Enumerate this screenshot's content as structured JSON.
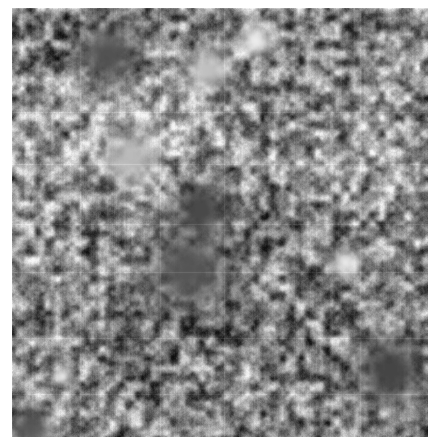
{
  "canvas": {
    "width": 437,
    "height": 447,
    "background_color": "#ffffff"
  },
  "image_panel": {
    "label": "grayscale-speckle-micrograph",
    "x": 12,
    "y": 8,
    "width": 416,
    "height": 429,
    "alt_text": "",
    "render": {
      "type": "speckle-noise",
      "colorspace": "grayscale",
      "mean_level": 138,
      "min_level": 16,
      "max_level": 246,
      "base_color": "#8a8a8a",
      "dark_color": "#1e1e1e",
      "light_color": "#f0f0f0",
      "blob_scale_px": 9,
      "fine_grain_px": 2,
      "contrast": 0.82,
      "vertical_streak_strength": 0.07,
      "seed": 20240517
    },
    "tiling": {
      "visible_seams": true,
      "seam_opacity": 0.07,
      "seam_color": "#ffffff",
      "columns_x": [
        0,
        68,
        148,
        212,
        282,
        348
      ],
      "rows_y": [
        0,
        104,
        156,
        216,
        264,
        330,
        386
      ]
    },
    "features": [
      {
        "name": "dark-point-center",
        "x": 189,
        "y": 201,
        "radius": 7,
        "level": 16
      },
      {
        "name": "dark-halo-center",
        "x": 189,
        "y": 201,
        "radius": 26,
        "level": 74
      },
      {
        "name": "bright-patch-upper-right",
        "x": 243,
        "y": 32,
        "radius": 17,
        "level": 236
      },
      {
        "name": "bright-blob-right",
        "x": 333,
        "y": 254,
        "radius": 14,
        "level": 232
      },
      {
        "name": "bright-spot-left-lower",
        "x": 50,
        "y": 368,
        "radius": 9,
        "level": 228
      },
      {
        "name": "dark-point-right",
        "x": 329,
        "y": 129,
        "radius": 5,
        "level": 36
      },
      {
        "name": "dark-cluster-lower-right",
        "x": 378,
        "y": 362,
        "radius": 34,
        "level": 70
      },
      {
        "name": "dark-region-upper-left",
        "x": 96,
        "y": 46,
        "radius": 30,
        "level": 82
      },
      {
        "name": "dark-band-center-lower",
        "x": 176,
        "y": 262,
        "radius": 40,
        "level": 86
      },
      {
        "name": "bright-region-mid-left",
        "x": 118,
        "y": 150,
        "radius": 28,
        "level": 186
      },
      {
        "name": "bright-region-upper-mid",
        "x": 196,
        "y": 62,
        "radius": 22,
        "level": 192
      },
      {
        "name": "dark-corner-bottom-left",
        "x": 18,
        "y": 420,
        "radius": 22,
        "level": 88
      }
    ]
  }
}
